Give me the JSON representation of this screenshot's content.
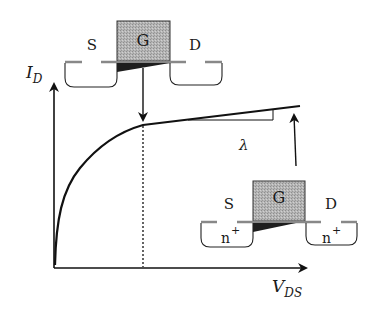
{
  "diagram": {
    "axes": {
      "y_label": "I",
      "y_label_sub": "D",
      "x_label": "V",
      "x_label_sub": "DS"
    },
    "slope_label": "λ",
    "transistor_top": {
      "source": "S",
      "gate": "G",
      "drain": "D",
      "description": "pinch-off at saturation onset"
    },
    "transistor_bottom": {
      "source": "S",
      "gate": "G",
      "drain": "D",
      "source_doping": "n",
      "drain_doping": "n",
      "doping_sup": "+",
      "description": "channel length modulation beyond saturation"
    },
    "colors": {
      "line": "#111111",
      "gate_fill": "#b8b8b8",
      "oxide": "#8a8a8a",
      "channel": "#222222"
    }
  }
}
